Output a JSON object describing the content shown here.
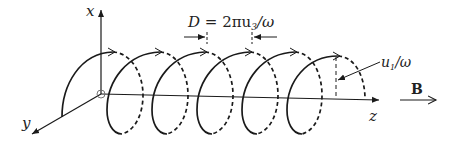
{
  "diagram": {
    "axes": {
      "x_label": "x",
      "y_label": "y",
      "z_label": "z"
    },
    "annotations": {
      "pitch_label_lhs": "D",
      "pitch_label_eq": " = 2πu",
      "pitch_label_sub": "3",
      "pitch_label_rhs": "/ω",
      "radius_label_main": "u",
      "radius_label_sub": "1",
      "radius_label_rhs": "/ω",
      "field_label": "B"
    },
    "helix": {
      "turns": 6,
      "front_style": "solid",
      "back_style": "dashed",
      "direction": "arrows along top of each turn pointing +z"
    },
    "colors": {
      "stroke": "#1a1a1a",
      "background": "#ffffff"
    }
  }
}
